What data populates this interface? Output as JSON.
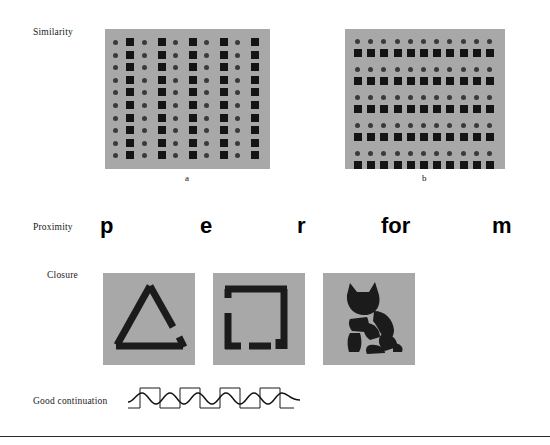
{
  "figure": {
    "background_color": "#ffffff",
    "panel_color": "#a8a8a8",
    "shape_dark": "#141414",
    "shape_dot": "#3a3a3a",
    "rule_color": "#2b2b2b"
  },
  "rows": {
    "similarity": {
      "label": "Similarity",
      "panels": [
        {
          "caption": "a",
          "grouping": "columns",
          "columns": 10,
          "rows": 10,
          "note": "alternating columns of circles and squares forming vertical groups"
        },
        {
          "caption": "b",
          "grouping": "rows",
          "columns": 11,
          "rows": 10,
          "note": "alternating rows of circles and squares forming horizontal pairs"
        }
      ]
    },
    "proximity": {
      "label": "Proximity",
      "word": "perform",
      "letters": [
        {
          "text": "p",
          "left": 100
        },
        {
          "text": "e",
          "left": 200
        },
        {
          "text": "r",
          "left": 297
        },
        {
          "text": "for",
          "left": 381
        },
        {
          "text": "m",
          "left": 492
        }
      ]
    },
    "closure": {
      "label": "Closure",
      "figures": [
        {
          "name": "incomplete-triangle"
        },
        {
          "name": "broken-square"
        },
        {
          "name": "fragmented-cat"
        }
      ]
    },
    "good_continuation": {
      "label": "Good continuation",
      "waves": [
        {
          "name": "sine-wave",
          "cycles": 3.5
        },
        {
          "name": "square-wave",
          "cycles": 3.5
        }
      ]
    }
  },
  "chart_data": {
    "type": "table",
    "categories": [
      "Similarity",
      "Proximity",
      "Closure",
      "Good continuation"
    ],
    "values": [
      2,
      5,
      3,
      2
    ],
    "series": [
      {
        "name": "illustrations per principle",
        "values": [
          2,
          5,
          3,
          2
        ]
      }
    ],
    "xlabel": "Gestalt principle",
    "ylabel": "Number of stimulus illustrations",
    "annotations": [
      "Similarity a: vertical grouping by alternating columns of circles and squares",
      "Similarity b: horizontal grouping by alternating rows of circles and squares",
      "Proximity: letters p e r for m grouped by spacing into 'perform'",
      "Closure: incomplete triangle, broken square, fragmented cat silhouette",
      "Good continuation: sine wave superimposed on square wave"
    ]
  }
}
